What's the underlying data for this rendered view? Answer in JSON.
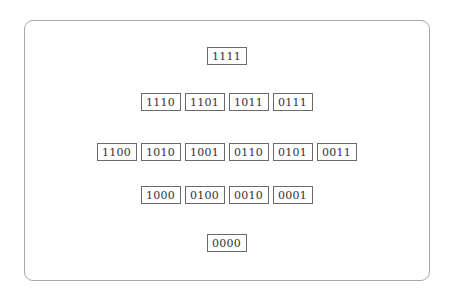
{
  "diagram": {
    "title": "",
    "levels": [
      {
        "label": "weight-4",
        "nodes": [
          "1111"
        ]
      },
      {
        "label": "weight-3",
        "nodes": [
          "1110",
          "1101",
          "1011",
          "0111"
        ]
      },
      {
        "label": "weight-2",
        "nodes": [
          "1100",
          "1010",
          "1001",
          "0110",
          "0101",
          "0011"
        ]
      },
      {
        "label": "weight-1",
        "nodes": [
          "1000",
          "0100",
          "0010",
          "0001"
        ]
      },
      {
        "label": "weight-0",
        "nodes": [
          "0000"
        ]
      }
    ]
  }
}
